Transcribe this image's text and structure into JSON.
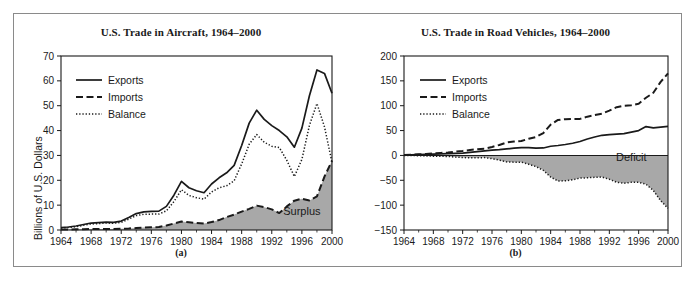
{
  "figure": {
    "panels": [
      {
        "id": "a",
        "caption": "(a)",
        "title": "U.S. Trade in Aircraft, 1964–2000",
        "ylabel": "Billions of U.S. Dollars",
        "area_label": "Surplus",
        "legend": [
          "Exports",
          "Imports",
          "Balance"
        ]
      },
      {
        "id": "b",
        "caption": "(b)",
        "title": "U.S. Trade in Road Vehicles, 1964–2000",
        "ylabel": "Billions of U.S. Dollars",
        "area_label": "Deficit",
        "legend": [
          "Exports",
          "Imports",
          "Balance"
        ]
      }
    ],
    "colors": {
      "line": "#1a1a1a",
      "area_fill": "#a8a8a8",
      "frame": "#8a8a8a",
      "background": "#ffffff"
    }
  },
  "chart_data": [
    {
      "type": "line",
      "title": "U.S. Trade in Aircraft, 1964–2000",
      "xlabel": "",
      "ylabel": "Billions of U.S. Dollars",
      "xlim": [
        1964,
        2000
      ],
      "ylim": [
        0,
        70
      ],
      "yticks": [
        0,
        10,
        20,
        30,
        40,
        50,
        60,
        70
      ],
      "xticks": [
        1964,
        1968,
        1972,
        1976,
        1980,
        1984,
        1988,
        1992,
        1996,
        2000
      ],
      "grid": false,
      "legend_position": "upper-left",
      "annotations": [
        {
          "text": "Surplus",
          "x": 1996,
          "y": 6
        }
      ],
      "x": [
        1964,
        1965,
        1966,
        1967,
        1968,
        1969,
        1970,
        1971,
        1972,
        1973,
        1974,
        1975,
        1976,
        1977,
        1978,
        1979,
        1980,
        1981,
        1982,
        1983,
        1984,
        1985,
        1986,
        1987,
        1988,
        1989,
        1990,
        1991,
        1992,
        1993,
        1994,
        1995,
        1996,
        1997,
        1998,
        1999,
        2000
      ],
      "series": [
        {
          "name": "Exports",
          "style": "solid",
          "values": [
            1.0,
            1.2,
            1.6,
            2.2,
            2.8,
            3.0,
            3.2,
            3.1,
            3.6,
            5.0,
            6.6,
            7.3,
            7.5,
            7.6,
            9.5,
            14.0,
            19.6,
            17.0,
            15.8,
            15.0,
            18.5,
            21.0,
            23.0,
            26.0,
            34.0,
            43.0,
            48.2,
            44.5,
            42.0,
            40.0,
            37.5,
            33.3,
            41.0,
            54.0,
            64.4,
            63.0,
            55.0
          ]
        },
        {
          "name": "Imports",
          "style": "dashed",
          "values": [
            0.2,
            0.2,
            0.3,
            0.3,
            0.4,
            0.4,
            0.4,
            0.4,
            0.5,
            0.6,
            0.8,
            1.0,
            1.1,
            1.2,
            1.8,
            2.6,
            3.4,
            3.1,
            2.8,
            2.6,
            3.2,
            4.0,
            5.2,
            6.2,
            7.4,
            8.5,
            9.8,
            9.2,
            8.3,
            6.8,
            9.5,
            11.8,
            12.6,
            11.9,
            13.5,
            21.5,
            27.8
          ]
        },
        {
          "name": "Balance",
          "style": "dotted",
          "values": [
            0.8,
            1.0,
            1.3,
            1.9,
            2.4,
            2.6,
            2.8,
            2.7,
            3.1,
            4.4,
            5.8,
            6.3,
            6.4,
            6.4,
            7.7,
            11.4,
            16.2,
            13.9,
            13.0,
            12.4,
            15.3,
            17.0,
            17.8,
            19.8,
            26.6,
            34.5,
            38.4,
            35.3,
            33.7,
            33.2,
            28.0,
            21.5,
            28.4,
            42.1,
            50.9,
            41.5,
            27.2
          ]
        }
      ]
    },
    {
      "type": "line",
      "title": "U.S. Trade in Road Vehicles, 1964–2000",
      "xlabel": "",
      "ylabel": "Billions of U.S. Dollars",
      "xlim": [
        1964,
        2000
      ],
      "ylim": [
        -150,
        200
      ],
      "yticks": [
        -150,
        -100,
        -50,
        0,
        50,
        100,
        150,
        200
      ],
      "xticks": [
        1964,
        1968,
        1972,
        1976,
        1980,
        1984,
        1988,
        1992,
        1996,
        2000
      ],
      "grid": false,
      "legend_position": "upper-left",
      "annotations": [
        {
          "text": "Deficit",
          "x": 1995,
          "y": -12
        }
      ],
      "x": [
        1964,
        1965,
        1966,
        1967,
        1968,
        1969,
        1970,
        1971,
        1972,
        1973,
        1974,
        1975,
        1976,
        1977,
        1978,
        1979,
        1980,
        1981,
        1982,
        1983,
        1984,
        1985,
        1986,
        1987,
        1988,
        1989,
        1990,
        1991,
        1992,
        1993,
        1994,
        1995,
        1996,
        1997,
        1998,
        1999,
        2000
      ],
      "series": [
        {
          "name": "Exports",
          "style": "solid",
          "values": [
            1.0,
            1.2,
            1.6,
            2.0,
            2.6,
            3.2,
            3.8,
            4.2,
            4.8,
            6.2,
            7.8,
            9.2,
            10.5,
            11.5,
            13.0,
            14.5,
            15.5,
            15.8,
            14.5,
            15.0,
            18.5,
            20.0,
            22.0,
            24.5,
            28.0,
            33.0,
            37.0,
            40.5,
            42.0,
            43.0,
            44.0,
            47.0,
            50.0,
            58.0,
            55.5,
            57.0,
            58.5
          ]
        },
        {
          "name": "Imports",
          "style": "dashed",
          "values": [
            1.1,
            1.4,
            2.2,
            3.0,
            4.2,
            5.0,
            5.8,
            7.5,
            9.0,
            11.0,
            12.5,
            13.5,
            17.0,
            21.0,
            26.0,
            28.0,
            29.0,
            33.5,
            37.0,
            45.0,
            62.0,
            71.5,
            73.0,
            73.5,
            73.5,
            78.0,
            81.0,
            84.0,
            90.0,
            97.0,
            100.0,
            101.0,
            104.0,
            116.0,
            126.0,
            148.0,
            165.0
          ]
        },
        {
          "name": "Balance",
          "style": "dotted",
          "values": [
            -0.1,
            -0.2,
            -0.6,
            -1.0,
            -1.6,
            -1.8,
            -2.0,
            -3.3,
            -4.2,
            -4.8,
            -4.7,
            -4.3,
            -6.5,
            -9.5,
            -13.0,
            -13.5,
            -13.5,
            -17.7,
            -22.5,
            -30.0,
            -43.5,
            -51.5,
            -51.0,
            -49.0,
            -45.5,
            -45.0,
            -44.0,
            -43.5,
            -48.0,
            -54.0,
            -56.0,
            -54.0,
            -54.0,
            -58.0,
            -70.5,
            -91.0,
            -106.5
          ]
        }
      ]
    }
  ]
}
